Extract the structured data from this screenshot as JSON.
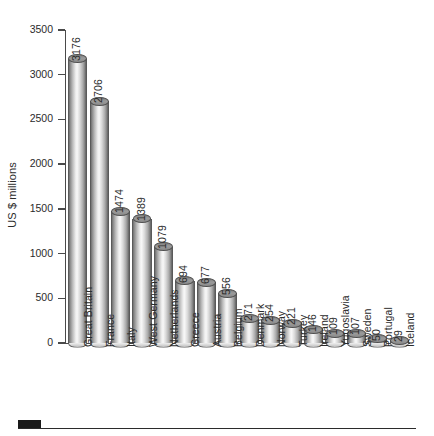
{
  "chart_data": {
    "type": "bar",
    "title": "",
    "subtitle": "",
    "xlabel": "",
    "ylabel": "US $ millions",
    "ylim": [
      0,
      3500
    ],
    "ytick_step": 500,
    "yticks": [
      0,
      500,
      1000,
      1500,
      2000,
      2500,
      3000,
      3500
    ],
    "ytick_labels": [
      "0",
      "500",
      "1000",
      "1500",
      "2000",
      "2500",
      "3000",
      "3500"
    ],
    "grid": false,
    "legend": null,
    "bar_style": "3d-cylinder",
    "data_labels": true,
    "data_label_rotation": 90,
    "category_label_rotation": 90,
    "categories": [
      "Great Britain",
      "France",
      "Italy",
      "West Germany",
      "Netherlands",
      "Greece",
      "Austria",
      "Belgium",
      "Denmark",
      "Norway",
      "Turkey",
      "Ireland",
      "Yugoslavia",
      "Sweden",
      "Portugal",
      "Iceland"
    ],
    "values": [
      3176,
      2706,
      1474,
      1389,
      1079,
      694,
      677,
      556,
      271,
      254,
      221,
      146,
      109,
      107,
      50,
      29
    ],
    "value_labels": [
      "3176",
      "2706",
      "1474",
      "1389",
      "1079",
      "694",
      "677",
      "556",
      "271",
      "254",
      "221",
      "146",
      "109",
      "107",
      "50",
      "29"
    ]
  },
  "decoration": {
    "bottom_rule": "horizontal-rule",
    "bottom_block": "black-square-marker"
  },
  "colors": {
    "axis": "#4a4a4a",
    "text": "#2b2b2b",
    "bar_light": "#f7f7f7",
    "bar_mid": "#bdbdbd",
    "bar_dark": "#5d5d5d",
    "bar_cap": "#9b9b9b",
    "background": "#ffffff",
    "rule": "#2b2b2b"
  }
}
